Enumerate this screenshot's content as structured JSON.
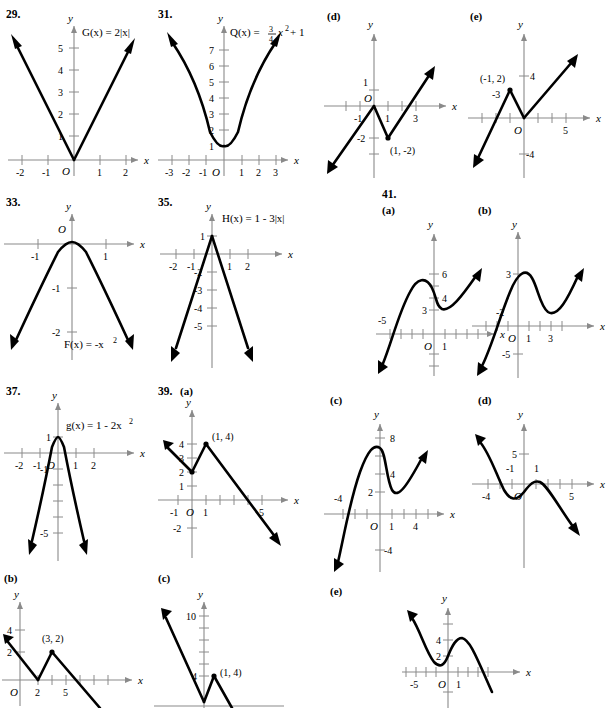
{
  "page": {
    "type": "textbook-answer-key-graphs",
    "width": 612,
    "height": 708,
    "background": "#ffffff",
    "curve_color": "#000000",
    "axis_color": "#8a8a8a"
  },
  "problems": [
    {
      "number": "29.",
      "part": "",
      "function_label": "G(x) = 2|x|",
      "axis_x": "x",
      "axis_y": "y",
      "origin_label": "O",
      "x_ticks": [
        "-2",
        "-1",
        "1",
        "2"
      ],
      "y_ticks": [
        "1",
        "2",
        "3",
        "4",
        "5"
      ],
      "description": "V-shaped absolute value graph, vertex at origin, slope 2"
    },
    {
      "number": "31.",
      "part": "",
      "function_label": "Q(x) = ¾ x² + 1",
      "function_label_parts": {
        "name": "Q(x) = ",
        "num": "3",
        "den": "4",
        "tail": "x",
        "exp": "2",
        "end": " + 1"
      },
      "axis_x": "x",
      "axis_y": "y",
      "origin_label": "O",
      "x_ticks": [
        "-3",
        "-2",
        "-1",
        "1",
        "2",
        "3"
      ],
      "y_ticks": [
        "1",
        "2",
        "3",
        "4",
        "5",
        "6",
        "7"
      ],
      "description": "Upward parabola, vertex (0,1)"
    },
    {
      "number": "33.",
      "part": "",
      "function_label": "F(x) = -x²",
      "axis_x": "x",
      "axis_y": "y",
      "origin_label": "O",
      "x_ticks": [
        "-1",
        "1"
      ],
      "y_ticks": [
        "-1",
        "-2"
      ],
      "description": "Downward parabola, vertex at origin"
    },
    {
      "number": "35.",
      "part": "",
      "function_label": "H(x) = 1 - 3|x|",
      "axis_x": "x",
      "axis_y": "y",
      "origin_label": "",
      "x_ticks": [
        "-2",
        "-1",
        "1",
        "2"
      ],
      "y_ticks": [
        "1",
        "-2",
        "-3",
        "-4",
        "-5"
      ],
      "description": "Inverted V absolute value graph, vertex (0,1), slope -3"
    },
    {
      "number": "37.",
      "part": "",
      "function_label": "g(x) = 1 - 2x²",
      "axis_x": "x",
      "axis_y": "y",
      "origin_label": "O",
      "x_ticks": [
        "-2",
        "-1",
        "1",
        "2"
      ],
      "y_ticks": [
        "1",
        "-1",
        "-5"
      ],
      "description": "Downward narrow parabola, vertex (0,1)"
    },
    {
      "number": "39.",
      "part": "(a)",
      "function_label": "",
      "axis_x": "x",
      "axis_y": "y",
      "origin_label": "O",
      "x_ticks": [
        "-1",
        "1",
        "5"
      ],
      "y_ticks": [
        "1",
        "2",
        "3",
        "4",
        "-2"
      ],
      "point_label": "(1, 4)",
      "description": "Piecewise linear, local min (0,2), peak (1,4), decreasing to right"
    },
    {
      "number": "",
      "part": "(b)",
      "function_label": "",
      "axis_x": "x",
      "axis_y": "y",
      "origin_label": "O",
      "x_ticks": [
        "2",
        "5"
      ],
      "y_ticks": [
        "2",
        "4"
      ],
      "point_label": "(3, 2)",
      "description": "Piecewise linear, min at (2,0), peak (3,2), decreasing"
    },
    {
      "number": "",
      "part": "(c)",
      "function_label": "",
      "axis_x": "x",
      "axis_y": "y",
      "origin_label": "",
      "x_ticks": [],
      "y_ticks": [
        "4",
        "10"
      ],
      "point_label": "(1, 4)",
      "description": "Steep V with peak (1,4), steep decreasing line from upper left"
    },
    {
      "number": "",
      "part": "(d)",
      "function_label": "",
      "axis_x": "x",
      "axis_y": "y",
      "origin_label": "O",
      "x_ticks": [
        "-1",
        "1",
        "3"
      ],
      "y_ticks": [
        "1",
        "-2"
      ],
      "point_label": "(1, -2)",
      "description": "Piecewise linear, peak (0,0), min (1,-2), rising to right"
    },
    {
      "number": "",
      "part": "(e)",
      "function_label": "",
      "axis_x": "x",
      "axis_y": "y",
      "origin_label": "O",
      "x_ticks": [
        "-3",
        "5"
      ],
      "y_ticks": [
        "4",
        "-4"
      ],
      "point_label": "(-1, 2)",
      "description": "Piecewise linear, peak (-1,2), min (0,0), rising to right"
    },
    {
      "number": "41.",
      "part": "(a)",
      "function_label": "",
      "axis_x": "x",
      "axis_y": "y",
      "origin_label": "O",
      "x_ticks": [
        "-5",
        "1"
      ],
      "y_ticks": [
        "3",
        "4",
        "6"
      ],
      "description": "Cubic-like curve, local max near (-2,6.5), local min near (1,3)"
    },
    {
      "number": "",
      "part": "(b)",
      "function_label": "",
      "axis_x": "x",
      "axis_y": "y",
      "origin_label": "O",
      "x_ticks": [
        "-2",
        "1",
        "3"
      ],
      "y_ticks": [
        "3",
        "-5"
      ],
      "description": "Cubic-like curve, local max near (1,3.3), local min near (3,1)"
    },
    {
      "number": "",
      "part": "(c)",
      "function_label": "",
      "axis_x": "x",
      "axis_y": "y",
      "origin_label": "O",
      "x_ticks": [
        "-4",
        "1",
        "4"
      ],
      "y_ticks": [
        "2",
        "4",
        "8",
        "-4"
      ],
      "description": "Cubic-like curve, local max near (-0.5,7.5), local min near (1.5,2)"
    },
    {
      "number": "",
      "part": "(d)",
      "function_label": "",
      "axis_x": "x",
      "axis_y": "y",
      "origin_label": "O",
      "x_ticks": [
        "-4",
        "-1",
        "1",
        "5"
      ],
      "y_ticks": [
        "5"
      ],
      "description": "Inverted cubic-like curve, local min near (-2,-2), local max near (1,0.5)"
    },
    {
      "number": "",
      "part": "(e)",
      "function_label": "",
      "axis_x": "x",
      "axis_y": "y",
      "origin_label": "O",
      "x_ticks": [
        "-5",
        "1"
      ],
      "y_ticks": [
        "2",
        "4"
      ],
      "description": "Inverted cubic-like curve, local min near (-2,1), local max near (1,4)"
    }
  ]
}
